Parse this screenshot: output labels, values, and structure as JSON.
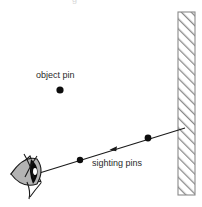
{
  "figure": {
    "title_fragment": "g",
    "width": 202,
    "height": 207,
    "background_color": "#ffffff",
    "line_color": "#1a1a1a",
    "wall_hatch_color": "#8a8a8a",
    "eye_fill_color": "#b0b0b0",
    "pupil_color": "#000000"
  },
  "labels": {
    "object_pin": "object pin",
    "sighting_pins": "sighting pins"
  },
  "diagram_data": {
    "type": "ray-diagram",
    "description": "Optics ray diagram: an eye viewing an object pin reflected in a plane mirror, with two sighting pins aligned along the line of sight.",
    "elements": [
      {
        "name": "mirror-wall",
        "kind": "hatched-rectangle",
        "x": 178,
        "y": 12,
        "width": 17,
        "height": 183,
        "hatch_angle_deg": 45
      },
      {
        "name": "object-pin-dot",
        "kind": "dot",
        "cx": 60,
        "cy": 90,
        "r": 3.6
      },
      {
        "name": "sight-line",
        "kind": "line",
        "x1": 33,
        "y1": 175,
        "x2": 185,
        "y2": 128
      },
      {
        "name": "sighting-pin-near",
        "kind": "dot",
        "cx": 80,
        "cy": 160,
        "r": 3.2
      },
      {
        "name": "sighting-pin-far",
        "kind": "dot",
        "cx": 148,
        "cy": 138,
        "r": 3.4
      },
      {
        "name": "direction-arrowhead",
        "kind": "arrowhead",
        "cx": 115,
        "cy": 149,
        "points_toward": "eye"
      },
      {
        "name": "eye",
        "kind": "eye-pictogram",
        "cx": 28,
        "cy": 172,
        "pupil_side": "right"
      }
    ]
  }
}
